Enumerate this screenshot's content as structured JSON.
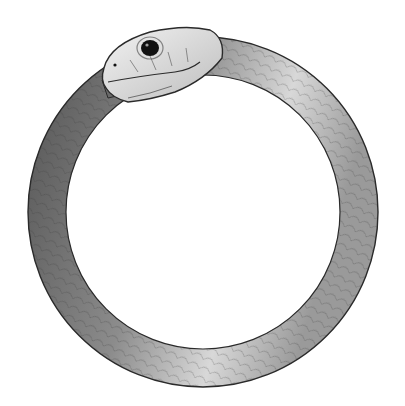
{
  "image": {
    "subject": "Ouroboros",
    "description": "Pencil/graphite illustration of a snake forming a circle while biting its own tail",
    "colors": {
      "background": "#ffffff",
      "body_dark": "#5e5e5e",
      "body_mid": "#8a8a8a",
      "body_light": "#e6e6e6",
      "outline": "#2a2a2a",
      "eye": "#111111"
    }
  }
}
